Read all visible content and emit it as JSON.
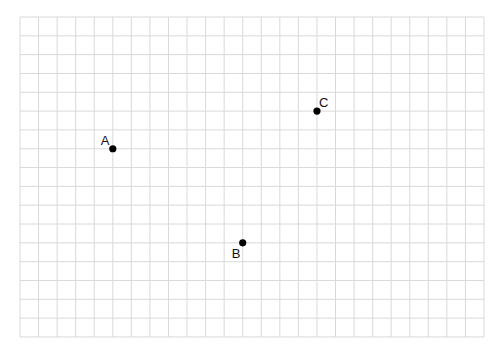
{
  "grid": {
    "left": 20,
    "top": 17,
    "columns": 25,
    "rows": 17,
    "cell_width": 18.56,
    "cell_height": 18.82,
    "line_color": "#d9d9d9",
    "background": "#ffffff"
  },
  "points": [
    {
      "label": "A",
      "col": 5,
      "row": 7,
      "label_dx": -12,
      "label_dy": -4
    },
    {
      "label": "B",
      "col": 12,
      "row": 12,
      "label_dx": -11,
      "label_dy": 15
    },
    {
      "label": "C",
      "col": 16,
      "row": 5,
      "label_dx": 2,
      "label_dy": -4
    }
  ],
  "point_style": {
    "radius": 3.6,
    "color": "#000000"
  }
}
